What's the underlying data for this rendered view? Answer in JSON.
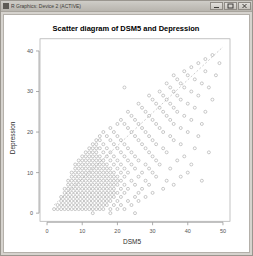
{
  "window": {
    "title": "R Graphics: Device 2 (ACTIVE)",
    "icon": "r-graphics-icon",
    "buttons": [
      {
        "name": "minimize-button",
        "glyph": "–"
      },
      {
        "name": "maximize-button",
        "glyph": "□"
      },
      {
        "name": "close-button",
        "glyph": "×"
      }
    ]
  },
  "chart_data": {
    "type": "scatter",
    "title": "Scatter diagram of DSM5 and Depression",
    "xlabel": "DSM5",
    "ylabel": "Depression",
    "xlim": [
      -2,
      52
    ],
    "ylim": [
      -2,
      43
    ],
    "xticks": [
      0,
      10,
      20,
      30,
      40,
      50
    ],
    "yticks": [
      0,
      10,
      20,
      30,
      40
    ],
    "grid": false,
    "legend": null,
    "marker": "open-circle",
    "marker_color": "#9d9d9d",
    "reference_line": {
      "style": "dashed",
      "color": "#b9b9b9",
      "x": [
        2,
        50
      ],
      "y": [
        2,
        41
      ],
      "slope": 0.8125,
      "intercept": 0.375
    },
    "points": [
      [
        2,
        1
      ],
      [
        3,
        1
      ],
      [
        4,
        1
      ],
      [
        5,
        1
      ],
      [
        6,
        1
      ],
      [
        7,
        1
      ],
      [
        8,
        1
      ],
      [
        9,
        1
      ],
      [
        10,
        1
      ],
      [
        11,
        1
      ],
      [
        12,
        1
      ],
      [
        13,
        1
      ],
      [
        14,
        1
      ],
      [
        15,
        1
      ],
      [
        16,
        1
      ],
      [
        18,
        1
      ],
      [
        20,
        1
      ],
      [
        22,
        1
      ],
      [
        3,
        2
      ],
      [
        4,
        2
      ],
      [
        5,
        2
      ],
      [
        6,
        2
      ],
      [
        7,
        2
      ],
      [
        8,
        2
      ],
      [
        9,
        2
      ],
      [
        10,
        2
      ],
      [
        11,
        2
      ],
      [
        12,
        2
      ],
      [
        13,
        2
      ],
      [
        14,
        2
      ],
      [
        15,
        2
      ],
      [
        16,
        2
      ],
      [
        17,
        2
      ],
      [
        19,
        2
      ],
      [
        21,
        2
      ],
      [
        24,
        2
      ],
      [
        4,
        3
      ],
      [
        5,
        3
      ],
      [
        6,
        3
      ],
      [
        7,
        3
      ],
      [
        8,
        3
      ],
      [
        9,
        3
      ],
      [
        10,
        3
      ],
      [
        11,
        3
      ],
      [
        12,
        3
      ],
      [
        13,
        3
      ],
      [
        14,
        3
      ],
      [
        15,
        3
      ],
      [
        16,
        3
      ],
      [
        17,
        3
      ],
      [
        18,
        3
      ],
      [
        20,
        3
      ],
      [
        23,
        3
      ],
      [
        26,
        3
      ],
      [
        4,
        4
      ],
      [
        5,
        4
      ],
      [
        6,
        4
      ],
      [
        7,
        4
      ],
      [
        8,
        4
      ],
      [
        9,
        4
      ],
      [
        10,
        4
      ],
      [
        11,
        4
      ],
      [
        12,
        4
      ],
      [
        13,
        4
      ],
      [
        14,
        4
      ],
      [
        15,
        4
      ],
      [
        16,
        4
      ],
      [
        17,
        4
      ],
      [
        18,
        4
      ],
      [
        19,
        4
      ],
      [
        21,
        4
      ],
      [
        25,
        4
      ],
      [
        28,
        4
      ],
      [
        5,
        5
      ],
      [
        6,
        5
      ],
      [
        7,
        5
      ],
      [
        8,
        5
      ],
      [
        9,
        5
      ],
      [
        10,
        5
      ],
      [
        11,
        5
      ],
      [
        12,
        5
      ],
      [
        13,
        5
      ],
      [
        14,
        5
      ],
      [
        15,
        5
      ],
      [
        16,
        5
      ],
      [
        17,
        5
      ],
      [
        18,
        5
      ],
      [
        19,
        5
      ],
      [
        20,
        5
      ],
      [
        22,
        5
      ],
      [
        26,
        5
      ],
      [
        30,
        5
      ],
      [
        5,
        6
      ],
      [
        6,
        6
      ],
      [
        7,
        6
      ],
      [
        8,
        6
      ],
      [
        9,
        6
      ],
      [
        10,
        6
      ],
      [
        11,
        6
      ],
      [
        12,
        6
      ],
      [
        13,
        6
      ],
      [
        14,
        6
      ],
      [
        15,
        6
      ],
      [
        16,
        6
      ],
      [
        17,
        6
      ],
      [
        18,
        6
      ],
      [
        19,
        6
      ],
      [
        21,
        6
      ],
      [
        23,
        6
      ],
      [
        27,
        6
      ],
      [
        33,
        6
      ],
      [
        6,
        7
      ],
      [
        7,
        7
      ],
      [
        8,
        7
      ],
      [
        9,
        7
      ],
      [
        10,
        7
      ],
      [
        11,
        7
      ],
      [
        12,
        7
      ],
      [
        13,
        7
      ],
      [
        14,
        7
      ],
      [
        15,
        7
      ],
      [
        16,
        7
      ],
      [
        17,
        7
      ],
      [
        18,
        7
      ],
      [
        19,
        7
      ],
      [
        20,
        7
      ],
      [
        22,
        7
      ],
      [
        25,
        7
      ],
      [
        29,
        7
      ],
      [
        36,
        7
      ],
      [
        6,
        8
      ],
      [
        7,
        8
      ],
      [
        8,
        8
      ],
      [
        9,
        8
      ],
      [
        10,
        8
      ],
      [
        11,
        8
      ],
      [
        12,
        8
      ],
      [
        13,
        8
      ],
      [
        14,
        8
      ],
      [
        15,
        8
      ],
      [
        16,
        8
      ],
      [
        17,
        8
      ],
      [
        18,
        8
      ],
      [
        19,
        8
      ],
      [
        20,
        8
      ],
      [
        21,
        8
      ],
      [
        24,
        8
      ],
      [
        28,
        8
      ],
      [
        34,
        8
      ],
      [
        44,
        8
      ],
      [
        7,
        9
      ],
      [
        8,
        9
      ],
      [
        9,
        9
      ],
      [
        10,
        9
      ],
      [
        11,
        9
      ],
      [
        12,
        9
      ],
      [
        13,
        9
      ],
      [
        14,
        9
      ],
      [
        15,
        9
      ],
      [
        16,
        9
      ],
      [
        17,
        9
      ],
      [
        18,
        9
      ],
      [
        19,
        9
      ],
      [
        20,
        9
      ],
      [
        22,
        9
      ],
      [
        26,
        9
      ],
      [
        31,
        9
      ],
      [
        38,
        9
      ],
      [
        7,
        10
      ],
      [
        8,
        10
      ],
      [
        9,
        10
      ],
      [
        10,
        10
      ],
      [
        11,
        10
      ],
      [
        12,
        10
      ],
      [
        13,
        10
      ],
      [
        14,
        10
      ],
      [
        15,
        10
      ],
      [
        16,
        10
      ],
      [
        17,
        10
      ],
      [
        18,
        10
      ],
      [
        19,
        10
      ],
      [
        21,
        10
      ],
      [
        23,
        10
      ],
      [
        27,
        10
      ],
      [
        30,
        10
      ],
      [
        40,
        10
      ],
      [
        8,
        11
      ],
      [
        9,
        11
      ],
      [
        10,
        11
      ],
      [
        11,
        11
      ],
      [
        12,
        11
      ],
      [
        13,
        11
      ],
      [
        14,
        11
      ],
      [
        15,
        11
      ],
      [
        16,
        11
      ],
      [
        17,
        11
      ],
      [
        18,
        11
      ],
      [
        20,
        11
      ],
      [
        22,
        11
      ],
      [
        25,
        11
      ],
      [
        29,
        11
      ],
      [
        35,
        11
      ],
      [
        8,
        12
      ],
      [
        9,
        12
      ],
      [
        10,
        12
      ],
      [
        11,
        12
      ],
      [
        12,
        12
      ],
      [
        13,
        12
      ],
      [
        14,
        12
      ],
      [
        15,
        12
      ],
      [
        16,
        12
      ],
      [
        17,
        12
      ],
      [
        19,
        12
      ],
      [
        21,
        12
      ],
      [
        24,
        12
      ],
      [
        28,
        12
      ],
      [
        32,
        12
      ],
      [
        41,
        12
      ],
      [
        9,
        13
      ],
      [
        10,
        13
      ],
      [
        11,
        13
      ],
      [
        12,
        13
      ],
      [
        13,
        13
      ],
      [
        14,
        13
      ],
      [
        15,
        13
      ],
      [
        16,
        13
      ],
      [
        18,
        13
      ],
      [
        20,
        13
      ],
      [
        23,
        13
      ],
      [
        26,
        13
      ],
      [
        31,
        13
      ],
      [
        37,
        13
      ],
      [
        10,
        14
      ],
      [
        11,
        14
      ],
      [
        12,
        14
      ],
      [
        13,
        14
      ],
      [
        14,
        14
      ],
      [
        15,
        14
      ],
      [
        17,
        14
      ],
      [
        19,
        14
      ],
      [
        22,
        14
      ],
      [
        25,
        14
      ],
      [
        30,
        14
      ],
      [
        39,
        14
      ],
      [
        11,
        15
      ],
      [
        12,
        15
      ],
      [
        13,
        15
      ],
      [
        14,
        15
      ],
      [
        16,
        15
      ],
      [
        18,
        15
      ],
      [
        21,
        15
      ],
      [
        24,
        15
      ],
      [
        29,
        15
      ],
      [
        34,
        15
      ],
      [
        46,
        15
      ],
      [
        12,
        16
      ],
      [
        13,
        16
      ],
      [
        14,
        16
      ],
      [
        15,
        16
      ],
      [
        17,
        16
      ],
      [
        20,
        16
      ],
      [
        23,
        16
      ],
      [
        28,
        16
      ],
      [
        33,
        16
      ],
      [
        42,
        16
      ],
      [
        13,
        17
      ],
      [
        14,
        17
      ],
      [
        16,
        17
      ],
      [
        19,
        17
      ],
      [
        22,
        17
      ],
      [
        27,
        17
      ],
      [
        31,
        17
      ],
      [
        38,
        17
      ],
      [
        14,
        18
      ],
      [
        15,
        18
      ],
      [
        18,
        18
      ],
      [
        21,
        18
      ],
      [
        26,
        18
      ],
      [
        30,
        18
      ],
      [
        36,
        18
      ],
      [
        15,
        19
      ],
      [
        17,
        19
      ],
      [
        20,
        19
      ],
      [
        25,
        19
      ],
      [
        29,
        19
      ],
      [
        35,
        19
      ],
      [
        43,
        19
      ],
      [
        16,
        20
      ],
      [
        19,
        20
      ],
      [
        24,
        20
      ],
      [
        28,
        20
      ],
      [
        33,
        20
      ],
      [
        40,
        20
      ],
      [
        18,
        21
      ],
      [
        23,
        21
      ],
      [
        27,
        21
      ],
      [
        32,
        21
      ],
      [
        38,
        21
      ],
      [
        20,
        22
      ],
      [
        22,
        22
      ],
      [
        26,
        22
      ],
      [
        31,
        22
      ],
      [
        36,
        22
      ],
      [
        44,
        22
      ],
      [
        21,
        23
      ],
      [
        25,
        23
      ],
      [
        30,
        23
      ],
      [
        35,
        23
      ],
      [
        41,
        23
      ],
      [
        24,
        24
      ],
      [
        29,
        24
      ],
      [
        34,
        24
      ],
      [
        39,
        24
      ],
      [
        23,
        25
      ],
      [
        28,
        25
      ],
      [
        33,
        25
      ],
      [
        37,
        25
      ],
      [
        45,
        25
      ],
      [
        27,
        26
      ],
      [
        32,
        26
      ],
      [
        36,
        26
      ],
      [
        42,
        26
      ],
      [
        26,
        27
      ],
      [
        31,
        27
      ],
      [
        35,
        27
      ],
      [
        40,
        27
      ],
      [
        30,
        28
      ],
      [
        34,
        28
      ],
      [
        38,
        28
      ],
      [
        47,
        28
      ],
      [
        29,
        29
      ],
      [
        33,
        29
      ],
      [
        37,
        29
      ],
      [
        43,
        29
      ],
      [
        32,
        30
      ],
      [
        36,
        30
      ],
      [
        41,
        30
      ],
      [
        22,
        31
      ],
      [
        35,
        31
      ],
      [
        39,
        31
      ],
      [
        46,
        31
      ],
      [
        34,
        32
      ],
      [
        38,
        32
      ],
      [
        44,
        32
      ],
      [
        37,
        33
      ],
      [
        42,
        33
      ],
      [
        36,
        34
      ],
      [
        40,
        34
      ],
      [
        48,
        34
      ],
      [
        39,
        35
      ],
      [
        45,
        35
      ],
      [
        41,
        36
      ],
      [
        43,
        37
      ],
      [
        49,
        37
      ],
      [
        45,
        38
      ],
      [
        47,
        39
      ],
      [
        13,
        0
      ],
      [
        18,
        0
      ],
      [
        25,
        0
      ]
    ]
  }
}
